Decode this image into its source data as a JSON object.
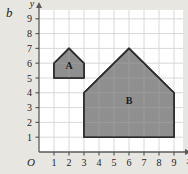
{
  "figure": {
    "panel_label": "b",
    "background_color": "#e8e6e1",
    "plot_background_color": "#ffffff"
  },
  "chart_data": {
    "type": "scatter",
    "title": "",
    "xlabel": "x",
    "ylabel": "y",
    "xlim": [
      0,
      9.6
    ],
    "ylim": [
      0,
      9.6
    ],
    "xticks": [
      1,
      2,
      3,
      4,
      5,
      6,
      7,
      8,
      9
    ],
    "yticks": [
      1,
      2,
      3,
      4,
      5,
      6,
      7,
      8,
      9
    ],
    "xtick_labels": [
      "1",
      "2",
      "3",
      "4",
      "5",
      "6",
      "7",
      "8",
      "9"
    ],
    "ytick_labels": [
      "1",
      "2",
      "3",
      "4",
      "5",
      "6",
      "7",
      "8",
      "9"
    ],
    "origin_label": "O",
    "grid": true,
    "grid_color": "#d8d8d8",
    "legend": null,
    "shapes": [
      {
        "name": "A",
        "label": "A",
        "label_point": [
          2,
          5.75
        ],
        "fill": "#858585",
        "stroke": "#2b2b2b",
        "vertices": [
          [
            1,
            5
          ],
          [
            3,
            5
          ],
          [
            3,
            6
          ],
          [
            2,
            7
          ],
          [
            1,
            6
          ]
        ]
      },
      {
        "name": "B",
        "label": "B",
        "label_point": [
          6,
          3.4
        ],
        "fill": "#858585",
        "stroke": "#2b2b2b",
        "vertices": [
          [
            3,
            1
          ],
          [
            9,
            1
          ],
          [
            9,
            4
          ],
          [
            6,
            7
          ],
          [
            3,
            4
          ]
        ]
      }
    ]
  },
  "axes": {
    "x_arrow": true,
    "y_arrow": true,
    "axis_color": "#5a5a5a"
  }
}
